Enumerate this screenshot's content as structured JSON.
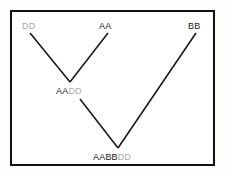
{
  "figure": {
    "kind": "genome-hybridization-diagram",
    "background_color": "#ffffff",
    "frame_color": "#111111",
    "line_color": "#1a1a1a",
    "dark_text_color": "#1a1a1a",
    "gray_text_color": "#a9a9a9",
    "nodes": {
      "parent_dd": {
        "full": "DD",
        "dark_part": "",
        "gray_part": "DD"
      },
      "parent_aa": {
        "full": "AA",
        "dark_part": "AA",
        "gray_part": ""
      },
      "parent_bb": {
        "full": "BB",
        "dark_part": "BB",
        "gray_part": ""
      },
      "hybrid_aadd": {
        "full": "AADD",
        "dark_part": "AA",
        "gray_part": "DD"
      },
      "hybrid_aabbdd": {
        "full": "AABBDD",
        "dark_part": "AABB",
        "gray_part": "DD"
      }
    },
    "edges": [
      {
        "from": "parent_dd",
        "to": "hybrid_aadd"
      },
      {
        "from": "parent_aa",
        "to": "hybrid_aadd"
      },
      {
        "from": "hybrid_aadd",
        "to": "hybrid_aabbdd"
      },
      {
        "from": "parent_bb",
        "to": "hybrid_aabbdd"
      }
    ]
  }
}
